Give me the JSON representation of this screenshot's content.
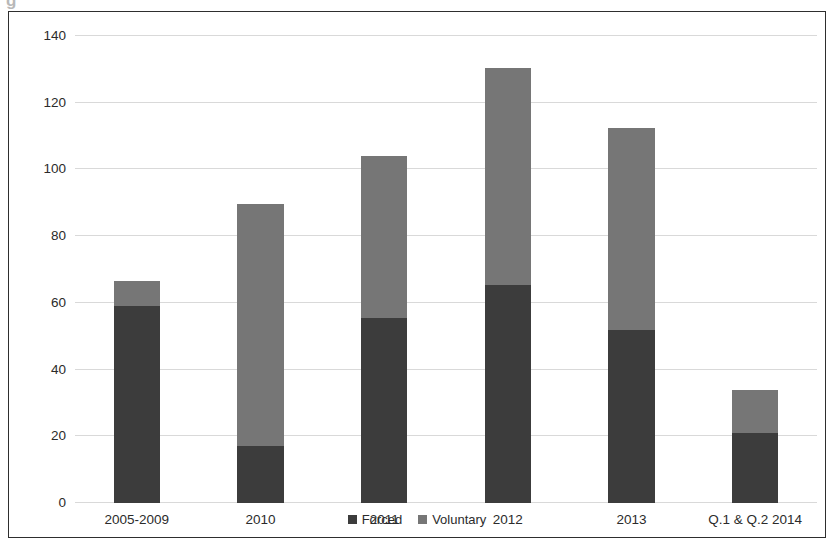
{
  "chart_data": {
    "type": "bar",
    "stacked": true,
    "title": "",
    "subtitle": "",
    "xlabel": "",
    "ylabel": "",
    "categories": [
      "2005-2009",
      "2010",
      "2011",
      "2012",
      "2013",
      "Q.1 & Q.2 2014"
    ],
    "series": [
      {
        "name": "Forced",
        "color": "#3c3c3c",
        "values": [
          59,
          17,
          55.5,
          65.5,
          52,
          21
        ]
      },
      {
        "name": "Voluntary",
        "color": "#767676",
        "values": [
          7.5,
          72.5,
          48.5,
          65,
          60.5,
          13
        ]
      }
    ],
    "totals": [
      66.5,
      89.5,
      104,
      130.5,
      112.5,
      34
    ],
    "ylim": [
      0,
      140
    ],
    "yticks": [
      0,
      20,
      40,
      60,
      80,
      100,
      120,
      140
    ],
    "ytick_labels": [
      "0",
      "20",
      "40",
      "60",
      "80",
      "100",
      "120",
      "140"
    ],
    "grid": true,
    "grid_color": "#d9d9d9",
    "legend": {
      "position": "bottom",
      "entries": [
        {
          "label": "Forced",
          "color": "#3c3c3c",
          "swatch": "square-swatch"
        },
        {
          "label": "Voluntary",
          "color": "#767676",
          "swatch": "square-swatch"
        }
      ]
    },
    "frame": {
      "border_color": "#2e2e2e",
      "background": "#ffffff"
    }
  },
  "artifact": {
    "glyph": "g"
  }
}
